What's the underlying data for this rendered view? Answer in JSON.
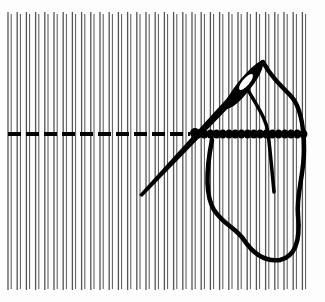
{
  "illustration": {
    "subject": "needle stitching a thread along a row of vertical warp threads",
    "colors": {
      "background": "#fdfdfd",
      "warp": "#555555",
      "ink": "#000000"
    },
    "warp": {
      "x_start": 8,
      "x_end": 305,
      "y_top": 12,
      "y_bottom": 290,
      "pair_spacing": 9.2,
      "pair_gap": 3.2
    },
    "stitch_row": {
      "y": 134,
      "dash_start": 8,
      "dash_end": 190,
      "dash_length": 13,
      "dash_gap": 5,
      "wrapped_start": 198,
      "wrapped_end": 307
    }
  }
}
